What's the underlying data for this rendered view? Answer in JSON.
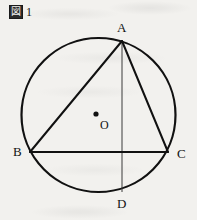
{
  "figure": {
    "caption_symbol": "図",
    "caption_symbol_name": "zu-kanji-figure-marker",
    "caption_number": "1",
    "full_caption": "図 1"
  },
  "canvas": {
    "width": 197,
    "height": 220,
    "background_color": "#f2f1ee",
    "ink_color": "#111111"
  },
  "labels": {
    "A": "A",
    "B": "B",
    "C": "C",
    "D": "D",
    "O": "O"
  },
  "chart_data": {
    "type": "diagram",
    "title": "図 1",
    "circle": {
      "name": "circumcircle",
      "center_label": "O",
      "cx": 98.5,
      "cy": 115,
      "r": 77,
      "stroke_width": 2.2
    },
    "center_dot": {
      "label": "O",
      "x": 96,
      "y": 114,
      "r": 2.6
    },
    "points": [
      {
        "label": "A",
        "x": 122,
        "y": 41,
        "on_circle": true,
        "label_pos": "above"
      },
      {
        "label": "B",
        "x": 30,
        "y": 152,
        "on_circle": true,
        "label_pos": "left"
      },
      {
        "label": "C",
        "x": 168,
        "y": 152,
        "on_circle": true,
        "label_pos": "right"
      },
      {
        "label": "D",
        "x": 122,
        "y": 192,
        "on_circle": true,
        "label_pos": "below"
      }
    ],
    "segments": [
      {
        "name": "AB",
        "from": "A",
        "to": "B",
        "x1": 122,
        "y1": 41,
        "x2": 30,
        "y2": 152,
        "stroke_width": 2.0
      },
      {
        "name": "AC",
        "from": "A",
        "to": "C",
        "x1": 122,
        "y1": 41,
        "x2": 168,
        "y2": 152,
        "stroke_width": 2.0
      },
      {
        "name": "BC",
        "from": "B",
        "to": "C",
        "x1": 30,
        "y1": 152,
        "x2": 168,
        "y2": 152,
        "stroke_width": 2.0
      },
      {
        "name": "AD",
        "from": "A",
        "to": "D",
        "x1": 122,
        "y1": 41,
        "x2": 122,
        "y2": 192,
        "stroke_width": 1.0
      }
    ],
    "grid": false,
    "legend": null
  }
}
